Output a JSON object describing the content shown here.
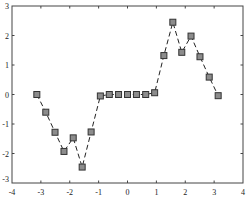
{
  "chart_data": {
    "type": "line",
    "title": "",
    "xlabel": "",
    "ylabel": "",
    "xlim": [
      -4,
      4
    ],
    "ylim": [
      -3,
      3
    ],
    "grid": false,
    "legend": null,
    "xticks": [
      -4,
      -3,
      -2,
      -1,
      0,
      1,
      2,
      3,
      4
    ],
    "yticks": [
      -3,
      -2,
      -1,
      0,
      1,
      2,
      3
    ],
    "xtick_labels": [
      "-4",
      "-3",
      "-2",
      "-1",
      "0",
      "1",
      "2",
      "3",
      "4"
    ],
    "ytick_labels": [
      "-3",
      "-2",
      "-1",
      "0",
      "1",
      "2",
      "3"
    ],
    "series": [
      {
        "name": "series-1",
        "line_style": "dashed",
        "line_color": "#222222",
        "marker": "square",
        "marker_fill": "#8c8c8c",
        "marker_edge": "#333333",
        "x": [
          -3.14,
          -2.83,
          -2.51,
          -2.2,
          -1.88,
          -1.57,
          -1.26,
          -0.94,
          -0.63,
          -0.31,
          0.0,
          0.31,
          0.63,
          0.94,
          1.26,
          1.57,
          1.88,
          2.2,
          2.51,
          2.83,
          3.14
        ],
        "y": [
          0.0,
          -0.6,
          -1.28,
          -1.93,
          -1.47,
          -2.46,
          -1.27,
          -0.05,
          0.0,
          0.0,
          0.0,
          0.0,
          0.0,
          0.06,
          1.32,
          2.45,
          1.43,
          1.98,
          1.28,
          0.59,
          -0.04
        ]
      }
    ]
  }
}
